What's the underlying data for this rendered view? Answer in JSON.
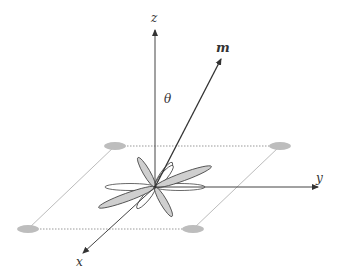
{
  "diagram": {
    "type": "3d-axes-with-magnetization-vector",
    "labels": {
      "z": "z",
      "y": "y",
      "x": "x",
      "m": "m",
      "theta": "θ"
    },
    "colors": {
      "axis": "#333333",
      "petal_fill_gray": "#cccccc",
      "petal_fill_white": "#ffffff",
      "ellipse": "#bdbdbd",
      "lattice_line": "#9a9a9a"
    }
  }
}
